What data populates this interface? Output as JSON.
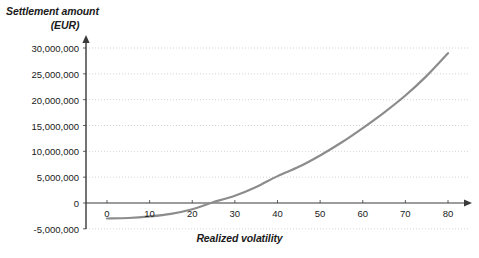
{
  "chart_data": {
    "type": "line",
    "title": "",
    "ylabel_line1": "Settlement amount",
    "ylabel_line2": "(EUR)",
    "xlabel": "Realized volatility",
    "xlim": [
      -2,
      82
    ],
    "ylim": [
      -5000000,
      31000000
    ],
    "grid": true,
    "legend": "none",
    "curve_color": "#8c8c8c",
    "axis_color": "#3a3a3a",
    "grid_color": "#c9c9c9",
    "yticks": [
      {
        "value": 30000000,
        "label": "30,000,000"
      },
      {
        "value": 25000000,
        "label": "25,000,000"
      },
      {
        "value": 20000000,
        "label": "20,000,000"
      },
      {
        "value": 15000000,
        "label": "15,000,000"
      },
      {
        "value": 10000000,
        "label": "10,000,000"
      },
      {
        "value": 5000000,
        "label": "5,000,000"
      },
      {
        "value": 0,
        "label": "0"
      },
      {
        "value": -5000000,
        "label": "-5,000,000"
      }
    ],
    "xticks": [
      {
        "value": 0,
        "label": "0"
      },
      {
        "value": 10,
        "label": "10"
      },
      {
        "value": 20,
        "label": "20"
      },
      {
        "value": 30,
        "label": "30"
      },
      {
        "value": 40,
        "label": "40"
      },
      {
        "value": 50,
        "label": "50"
      },
      {
        "value": 60,
        "label": "60"
      },
      {
        "value": 70,
        "label": "70"
      },
      {
        "value": 80,
        "label": "80"
      }
    ],
    "series": [
      {
        "name": "Settlement amount",
        "x": [
          0,
          5,
          10,
          15,
          20,
          24,
          25,
          30,
          35,
          40,
          45,
          50,
          55,
          60,
          65,
          70,
          75,
          80
        ],
        "values": [
          -3000000,
          -2900000,
          -2600000,
          -2100000,
          -1200000,
          -100000,
          200000,
          1400000,
          3100000,
          5200000,
          7000000,
          9200000,
          11700000,
          14500000,
          17500000,
          20800000,
          24600000,
          29000000
        ]
      }
    ]
  }
}
